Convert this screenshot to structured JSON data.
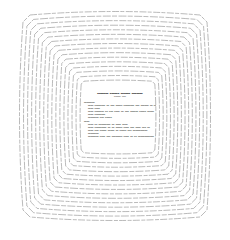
{
  "document": {
    "title": "▬▬▬▬▬▬▬ ▬▬▬▬▬▬ ▬▬▬▬▬▬ ▬▬▬▬▬▬▬",
    "subtitle": "▬▬▬▬▬ ▬▬▬",
    "sections": [
      {
        "heading": "▬▬▬▬▬▬▬▬",
        "items": [
          "▬▬▬▬ ▬▬▬▬▬▬▬▬ ▬▬ ▬▬▬ ▬▬▬▬▬ ▬▬▬▬▬▬▬▬ ▬▬▬ ▬▬▬▬▬▬ ▬▬ ▬▬▬▬▬",
          "▬▬▬▬ ▬▬▬▬",
          "▬▬▬▬ ▬▬▬▬▬▬▬ ▬▬ ▬▬▬ ▬▬▬▬ ▬▬ ▬▬▬ ▬▬▬▬▬▬ ▬▬▬▬▬ ▬▬▬▬▬",
          "▬▬▬▬ ▬▬▬▬▬▬▬▬",
          "▬▬▬▬▬▬▬▬ ▬▬▬ ▬▬▬▬▬"
        ]
      },
      {
        "heading": "▬▬▬▬",
        "items": [
          "▬▬▬▬ ▬▬ ▬▬▬▬▬▬▬▬▬ ▬▬ ▬▬▬▬ ▬▬▬▬",
          "▬▬▬▬ ▬▬▬▬▬▬▬▬▬ ▬▬ ▬▬ ▬▬▬▬▬ ▬▬▬▬ ▬▬▬ ▬▬▬▬ ▬▬▬ ▬▬",
          "▬▬▬▬ ▬▬▬ ▬▬▬▬▬ ▬▬▬▬▬ ▬▬ ▬▬▬▬▬ ▬▬▬ ▬▬▬▬▬▬▬▬▬▬▬",
          "▬▬▬▬▬▬▬▬",
          "▬▬▬▬▬▬▬▬ ▬▬▬▬ ▬▬▬ ▬▬▬▬▬▬▬▬ ▬▬▬▬ ▬▬ ▬▬ ▬▬▬▬▬▬▬▬▬▬▬▬"
        ]
      }
    ]
  },
  "rings": {
    "count": 16,
    "stroke_color": "#8a8a8a",
    "outer_box": {
      "left": 20,
      "top": 12,
      "right": 210,
      "bottom": 220
    },
    "inner_box": {
      "left": 80,
      "top": 80,
      "right": 156,
      "bottom": 154
    }
  }
}
